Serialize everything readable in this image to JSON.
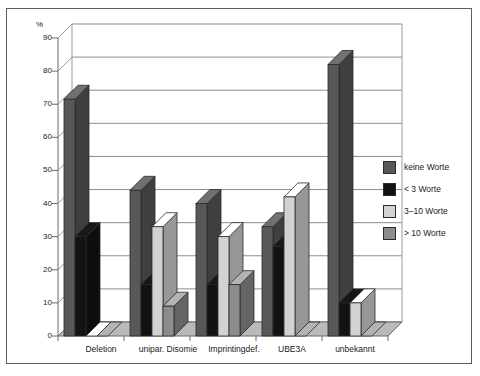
{
  "chart_data": {
    "type": "bar",
    "title": "",
    "subtitle": "",
    "xlabel": "",
    "ylabel": "%",
    "ylim": [
      0,
      90
    ],
    "ytick_step": 10,
    "yticks": [
      0,
      10,
      20,
      30,
      40,
      50,
      60,
      70,
      80,
      90
    ],
    "grid": true,
    "legend_position": "right",
    "style": "3d-clustered-column-grayscale",
    "categories": [
      "Deletion",
      "unipar. Disomie",
      "Imprintingdef.",
      "UBE3A",
      "unbekannt"
    ],
    "series": [
      {
        "name": "keine Worte",
        "color": "#585858",
        "values": [
          71.5,
          44,
          40,
          33,
          82
        ]
      },
      {
        "name": "< 3 Worte",
        "color": "#121212",
        "values": [
          30,
          15.5,
          15.5,
          27,
          10
        ]
      },
      {
        "name": "3–10 Worte",
        "color": "#d2d2d2",
        "values": [
          0,
          33,
          30,
          42,
          10
        ]
      },
      {
        "name": "> 10 Worte",
        "color": "#8c8c8c",
        "values": [
          0,
          9,
          15.5,
          0,
          0
        ]
      }
    ]
  },
  "axis": {
    "unit_label": "%",
    "tick_0": "0",
    "tick_10": "10",
    "tick_20": "20",
    "tick_30": "30",
    "tick_40": "40",
    "tick_50": "50",
    "tick_60": "60",
    "tick_70": "70",
    "tick_80": "80",
    "tick_90": "90"
  },
  "categories": {
    "c0": "Deletion",
    "c1": "unipar. Disomie",
    "c2": "Imprintingdef.",
    "c3": "UBE3A",
    "c4": "unbekannt"
  },
  "legend": {
    "items": [
      {
        "label": "keine Worte",
        "color": "#585858"
      },
      {
        "label": "< 3 Worte",
        "color": "#121212"
      },
      {
        "label": "3–10 Worte",
        "color": "#d2d2d2"
      },
      {
        "label": "> 10 Worte",
        "color": "#8c8c8c"
      }
    ],
    "l0": "keine Worte",
    "l1": "< 3 Worte",
    "l2": "3–10 Worte",
    "l3": "> 10 Worte"
  }
}
